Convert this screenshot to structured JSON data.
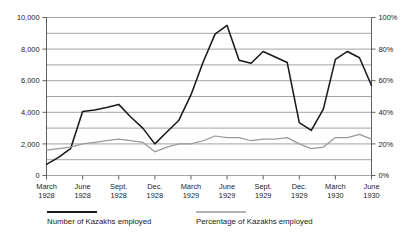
{
  "chart_data": {
    "type": "line",
    "title": "",
    "xlabel": "",
    "ylabel": "",
    "grid": true,
    "legend_position": "bottom",
    "x_tick_labels": [
      {
        "month": "March",
        "year": "1928"
      },
      {
        "month": "June",
        "year": "1928"
      },
      {
        "month": "Sept.",
        "year": "1928"
      },
      {
        "month": "Dec.",
        "year": "1928"
      },
      {
        "month": "March",
        "year": "1929"
      },
      {
        "month": "June",
        "year": "1929"
      },
      {
        "month": "Sept.",
        "year": "1929"
      },
      {
        "month": "Dec.",
        "year": "1929"
      },
      {
        "month": "March",
        "year": "1930"
      },
      {
        "month": "June",
        "year": "1930"
      }
    ],
    "left_axis": {
      "ylim": [
        0,
        10000
      ],
      "tick_labels": [
        "10,000",
        "8,000",
        "6,000",
        "4,000",
        "2,000",
        "0"
      ],
      "tick_values": [
        10000,
        8000,
        6000,
        4000,
        2000,
        0
      ],
      "gridline_values": [
        10000,
        9000,
        8000,
        7000,
        6000,
        5000,
        4000,
        3000,
        2000,
        1000,
        0
      ]
    },
    "right_axis": {
      "ylim": [
        0,
        100
      ],
      "tick_labels": [
        "100%",
        "80%",
        "60%",
        "40%",
        "20%",
        "0%"
      ],
      "tick_values": [
        100,
        80,
        60,
        40,
        20,
        0
      ]
    },
    "x": [
      "March 1928",
      "April 1928",
      "May 1928",
      "June 1928",
      "July 1928",
      "Aug. 1928",
      "Sept. 1928",
      "Oct. 1928",
      "Nov. 1928",
      "Dec. 1928",
      "Jan. 1929",
      "Feb. 1929",
      "March 1929",
      "April 1929",
      "May 1929",
      "June 1929",
      "July 1929",
      "Aug. 1929",
      "Sept. 1929",
      "Oct. 1929",
      "Nov. 1929",
      "Dec. 1929",
      "Jan. 1930",
      "Feb. 1930",
      "March 1930",
      "April 1930",
      "May 1930",
      "June 1930"
    ],
    "series": [
      {
        "name": "Number of Kazakhs employed",
        "axis": "left",
        "color": "#1a1a1a",
        "values": [
          700,
          1150,
          1700,
          4050,
          4150,
          4300,
          4500,
          3700,
          3000,
          2000,
          2750,
          3500,
          5100,
          7150,
          8950,
          9500,
          7300,
          7100,
          7850,
          7500,
          7150,
          3350,
          2850,
          4200,
          7350,
          7850,
          7450,
          5700
        ]
      },
      {
        "name": "Percentage of Kazakhs employed",
        "axis": "right",
        "color": "#9a9a9a",
        "values": [
          16,
          17,
          18,
          20,
          21,
          22,
          23,
          22,
          21,
          15,
          18,
          20,
          20,
          22,
          25,
          24,
          24,
          22,
          23,
          23,
          24,
          20,
          17,
          18,
          24,
          24,
          26,
          23
        ]
      }
    ],
    "legend": [
      {
        "label": "Number of Kazakhs employed",
        "color": "#1a1a1a"
      },
      {
        "label": "Percentage of Kazakhs employed",
        "color": "#9a9a9a"
      }
    ]
  }
}
